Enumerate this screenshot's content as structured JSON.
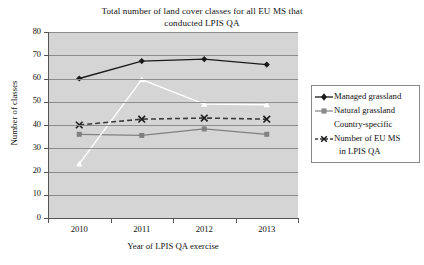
{
  "chart_data": {
    "type": "line",
    "title": "Total number of land cover classes for all EU MS that conducted LPIS QA",
    "title_line1": "Total number of land cover classes for all EU MS that",
    "title_line2": "conducted LPIS QA",
    "xlabel": "Year of LPIS QA exercise",
    "ylabel": "Number of classes",
    "categories": [
      "2010",
      "2011",
      "2012",
      "2013"
    ],
    "x": [
      2010,
      2011,
      2012,
      2013
    ],
    "ylim": [
      0,
      80
    ],
    "ytick_labels": [
      "0",
      "10",
      "20",
      "30",
      "40",
      "50",
      "60",
      "70",
      "80"
    ],
    "yticks": [
      0,
      10,
      20,
      30,
      40,
      50,
      60,
      70,
      80
    ],
    "grid": "horizontal",
    "legend_position": "right",
    "plot_background": "#d5d5d5",
    "series": [
      {
        "name": "Managed grassland",
        "values": [
          60,
          67.5,
          68.3,
          66
        ],
        "color": "#1a1a1a",
        "marker": "diamond",
        "line_style": "solid"
      },
      {
        "name": "Natural grassland",
        "values": [
          36,
          35.5,
          38.3,
          36
        ],
        "color": "#808080",
        "marker": "square",
        "line_style": "solid"
      },
      {
        "name": "Country-specific",
        "values": [
          23.3,
          59.5,
          49,
          48.7
        ],
        "color": "#ffffff",
        "marker": "triangle",
        "line_style": "solid"
      },
      {
        "name": "Number of EU MS in LPIS QA",
        "name_line1": "Number of EU MS",
        "name_line2": "in LPIS QA",
        "values": [
          40,
          42.5,
          43,
          42.5
        ],
        "color": "#3a3a3a",
        "marker": "cross-x",
        "line_style": "dashed"
      }
    ]
  },
  "legend": {
    "items": [
      {
        "label": "Managed grassland",
        "key": "diamond-marker-key"
      },
      {
        "label": "Natural grassland",
        "key": "square-marker-key"
      },
      {
        "label": "Country-specific",
        "key": "triangle-marker-key"
      },
      {
        "label_line1": "Number of EU MS",
        "label_line2": "in LPIS QA",
        "key": "cross-marker-key"
      }
    ]
  }
}
